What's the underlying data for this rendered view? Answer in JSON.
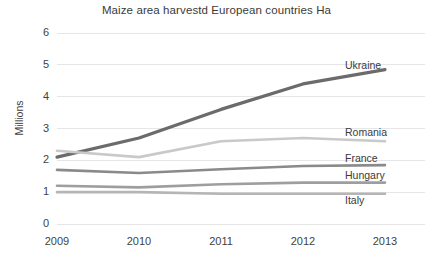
{
  "chart_data": {
    "type": "line",
    "title": "Maize area harvestd European countries Ha",
    "xlabel": "",
    "ylabel": "Millions",
    "categories": [
      "2009",
      "2010",
      "2011",
      "2012",
      "2013"
    ],
    "x": [
      2009,
      2010,
      2011,
      2012,
      2013
    ],
    "ylim": [
      0,
      6
    ],
    "yticks": [
      "0",
      "1",
      "2",
      "3",
      "4",
      "5",
      "6"
    ],
    "ytick_values": [
      0,
      1,
      2,
      3,
      4,
      5,
      6
    ],
    "grid": "horizontal",
    "legend_position": "inline-right",
    "series": [
      {
        "name": "Ukraine",
        "values": [
          2.1,
          2.7,
          3.6,
          4.4,
          4.85
        ],
        "color": "#6b6b6b",
        "width": 3.2,
        "label_y": 4.95
      },
      {
        "name": "Romania",
        "values": [
          2.3,
          2.1,
          2.6,
          2.7,
          2.6
        ],
        "color": "#c9c9c9",
        "width": 2.6,
        "label_y": 2.85
      },
      {
        "name": "France",
        "values": [
          1.7,
          1.6,
          1.72,
          1.82,
          1.85
        ],
        "color": "#8a8a8a",
        "width": 2.6,
        "label_y": 2.05
      },
      {
        "name": "Hungary",
        "values": [
          1.2,
          1.15,
          1.25,
          1.3,
          1.3
        ],
        "color": "#9e9e9e",
        "width": 2.6,
        "label_y": 1.5
      },
      {
        "name": "Italy",
        "values": [
          1.0,
          1.0,
          0.95,
          0.95,
          0.95
        ],
        "color": "#b5b5b5",
        "width": 2.6,
        "label_y": 0.72
      }
    ],
    "colors": {
      "grid": "#e6e6e6",
      "text": "#3f3f3f",
      "background": "#ffffff"
    }
  }
}
